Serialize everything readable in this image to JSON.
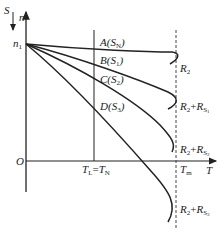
{
  "diagram": {
    "type": "mechanical characteristic curves",
    "axes": {
      "y_axis": {
        "label": "n",
        "secondary_label": "S",
        "secondary_arrow": "downward"
      },
      "x_axis": {
        "label": "T"
      },
      "origin": "O",
      "y_mark": {
        "symbol": "n",
        "sub": "1"
      }
    },
    "markers": {
      "load_torque": {
        "left": "T",
        "left_sub": "L",
        "eq": "=",
        "right": "T",
        "right_sub": "N"
      },
      "max_torque": {
        "symbol": "T",
        "sub": "m",
        "style": "dashed"
      }
    },
    "curves": [
      {
        "point": "A",
        "slip": "S",
        "slip_sub": "N",
        "resistance": "R",
        "res_sub": "2",
        "extra": ""
      },
      {
        "point": "B",
        "slip": "S",
        "slip_sub": "1",
        "resistance": "R",
        "res_sub": "2",
        "extra": "R",
        "extra_sub": "S",
        "extra_sub2": "1"
      },
      {
        "point": "C",
        "slip": "S",
        "slip_sub": "2",
        "resistance": "R",
        "res_sub": "2",
        "extra": "R",
        "extra_sub": "S",
        "extra_sub2": "2"
      },
      {
        "point": "D",
        "slip": "S",
        "slip_sub": "3",
        "resistance": "R",
        "res_sub": "2",
        "extra": "R",
        "extra_sub": "S",
        "extra_sub2": "3"
      }
    ],
    "colors": {
      "line": "#222222",
      "background": "#ffffff"
    }
  }
}
